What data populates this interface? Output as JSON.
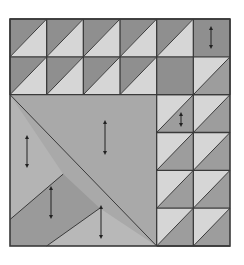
{
  "quilt": {
    "x": 10,
    "y": 19,
    "w": 220,
    "h": 227,
    "cols": 6,
    "rows": 6,
    "colors": {
      "dark": "#8f8f8f",
      "medium": "#a9a9a9",
      "light": "#d6d6d6",
      "mottled": "#9a9a9a",
      "line": "#3a3a3a",
      "background": "#ffffff"
    },
    "hst_cells": [
      {
        "c": 0,
        "r": 0,
        "type": "dark-tl"
      },
      {
        "c": 1,
        "r": 0,
        "type": "dark-tl"
      },
      {
        "c": 2,
        "r": 0,
        "type": "dark-tl"
      },
      {
        "c": 3,
        "r": 0,
        "type": "dark-tl"
      },
      {
        "c": 4,
        "r": 0,
        "type": "dark-tl"
      },
      {
        "c": 0,
        "r": 1,
        "type": "dark-tl"
      },
      {
        "c": 1,
        "r": 1,
        "type": "dark-tl"
      },
      {
        "c": 2,
        "r": 1,
        "type": "dark-tl"
      },
      {
        "c": 3,
        "r": 1,
        "type": "dark-tl"
      },
      {
        "c": 5,
        "r": 1,
        "type": "light-tl"
      },
      {
        "c": 4,
        "r": 2,
        "type": "light-tl"
      },
      {
        "c": 5,
        "r": 2,
        "type": "light-tl"
      },
      {
        "c": 4,
        "r": 3,
        "type": "light-tl"
      },
      {
        "c": 5,
        "r": 3,
        "type": "light-tl"
      },
      {
        "c": 4,
        "r": 4,
        "type": "light-tl"
      },
      {
        "c": 5,
        "r": 4,
        "type": "light-tl"
      },
      {
        "c": 4,
        "r": 5,
        "type": "light-tl"
      },
      {
        "c": 5,
        "r": 5,
        "type": "light-tl"
      }
    ],
    "solid_cells": [
      {
        "c": 5,
        "r": 0
      },
      {
        "c": 4,
        "r": 1
      }
    ],
    "arrows": [
      {
        "x": 211,
        "y1": 26,
        "y2": 49
      },
      {
        "x": 181,
        "y1": 112,
        "y2": 127
      },
      {
        "x": 105,
        "y1": 120,
        "y2": 155
      },
      {
        "x": 27,
        "y1": 135,
        "y2": 168
      },
      {
        "x": 51,
        "y1": 186,
        "y2": 219
      },
      {
        "x": 101,
        "y1": 205,
        "y2": 239
      }
    ]
  }
}
